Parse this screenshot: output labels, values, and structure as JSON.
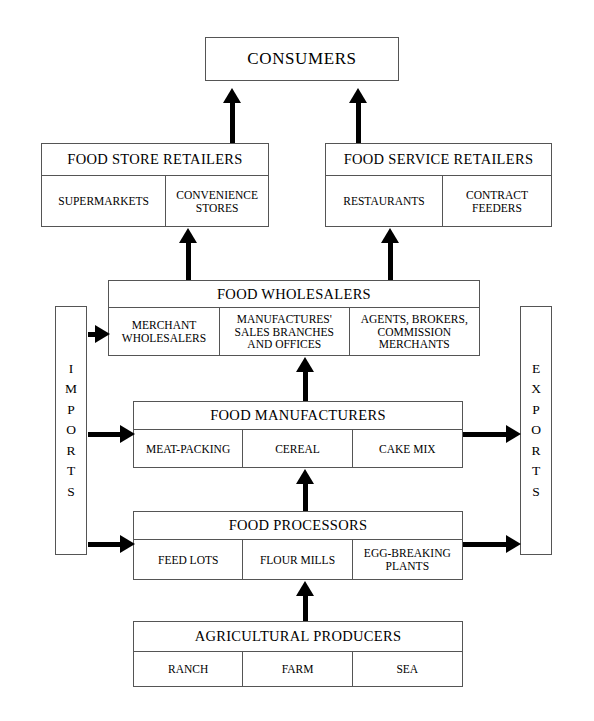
{
  "diagram": {
    "consumers": {
      "label": "CONSUMERS"
    },
    "food_store_retailers": {
      "header": "FOOD STORE RETAILERS",
      "cells": [
        "SUPERMARKETS",
        "CONVENIENCE STORES"
      ]
    },
    "food_service_retailers": {
      "header": "FOOD SERVICE RETAILERS",
      "cells": [
        "RESTAURANTS",
        "CONTRACT FEEDERS"
      ]
    },
    "food_wholesalers": {
      "header": "FOOD WHOLESALERS",
      "cells": [
        "MERCHANT WHOLESALERS",
        "MANUFACTURES' SALES BRANCHES AND OFFICES",
        "AGENTS, BROKERS, COMMISSION MERCHANTS"
      ]
    },
    "food_manufacturers": {
      "header": "FOOD MANUFACTURERS",
      "cells": [
        "MEAT-PACKING",
        "CEREAL",
        "CAKE MIX"
      ]
    },
    "food_processors": {
      "header": "FOOD PROCESSORS",
      "cells": [
        "FEED LOTS",
        "FLOUR MILLS",
        "EGG-BREAKING PLANTS"
      ]
    },
    "agricultural_producers": {
      "header": "AGRICULTURAL PRODUCERS",
      "cells": [
        "RANCH",
        "FARM",
        "SEA"
      ]
    },
    "imports": {
      "label": "IMPORTS",
      "letters": [
        "I",
        "M",
        "P",
        "O",
        "R",
        "T",
        "S"
      ]
    },
    "exports": {
      "label": "EXPORTS",
      "letters": [
        "E",
        "X",
        "P",
        "O",
        "R",
        "T",
        "S"
      ]
    },
    "colors": {
      "line": "#555555",
      "fill": "#ffffff",
      "arrow": "#000000",
      "text": "#000000"
    }
  }
}
